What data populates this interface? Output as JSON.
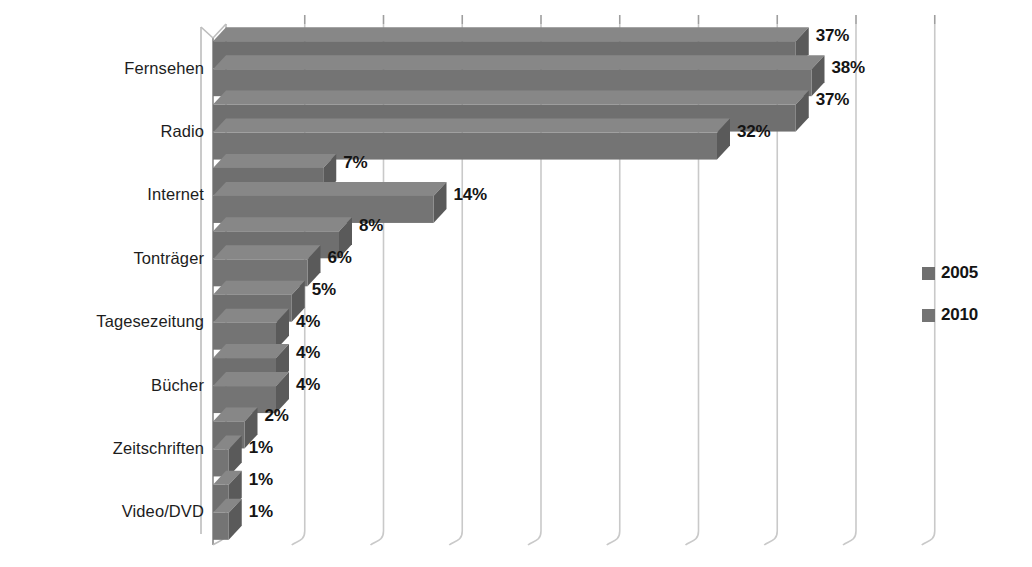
{
  "chart_data": {
    "type": "bar",
    "orientation": "horizontal",
    "title": "",
    "subtitle": "",
    "xlabel": "",
    "ylabel": "",
    "grid": true,
    "legend_position": "right",
    "xlim": [
      0,
      45
    ],
    "xtick_interval": 5,
    "value_suffix": "%",
    "categories": [
      "Fernsehen",
      "Radio",
      "Internet",
      "Tonträger",
      "Tagesezeitung",
      "Bücher",
      "Zeitschriften",
      "Video/DVD"
    ],
    "series": [
      {
        "name": "2005",
        "color": "#6f6f6f",
        "values": [
          37,
          37,
          7,
          8,
          5,
          4,
          2,
          1
        ],
        "labels": [
          "37%",
          "37%",
          "7%",
          "8%",
          "5%",
          "4%",
          "2%",
          "1%"
        ]
      },
      {
        "name": "2010",
        "color": "#747474",
        "values": [
          38,
          32,
          14,
          6,
          4,
          4,
          1,
          1
        ],
        "labels": [
          "38%",
          "32%",
          "14%",
          "6%",
          "4%",
          "4%",
          "1%",
          "1%"
        ]
      }
    ]
  },
  "legend": {
    "items": [
      {
        "label": "2005",
        "color": "#6f6f6f"
      },
      {
        "label": "2010",
        "color": "#747474"
      }
    ]
  },
  "style": {
    "background": "#ffffff",
    "bar_fill": "#6f6f6f",
    "bar_top_fill": "#878787",
    "bar_side_fill": "#5a5a5a",
    "axis_color": "#b5b5b5",
    "grid_color": "#c9c9c9",
    "text_color": "#1a1a1a"
  }
}
